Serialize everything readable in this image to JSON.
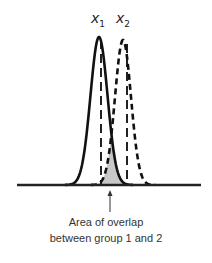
{
  "diagram": {
    "type": "overlapping-normal-distributions",
    "labels": {
      "group1": {
        "var": "x",
        "sub": "1"
      },
      "group2": {
        "var": "x",
        "sub": "2"
      }
    },
    "caption": {
      "line1": "Area of overlap",
      "line2": "between group 1 and 2"
    },
    "curves": [
      {
        "name": "group 1",
        "style": "solid",
        "mean_x": 99,
        "sd_px": 8.5,
        "peak_y": 37
      },
      {
        "name": "group 2",
        "style": "dashed",
        "mean_x": 123,
        "sd_px": 8,
        "peak_y": 40
      }
    ],
    "colors": {
      "line": "#111111",
      "overlap_fill": "#c8c8c8",
      "text": "#333333"
    }
  }
}
